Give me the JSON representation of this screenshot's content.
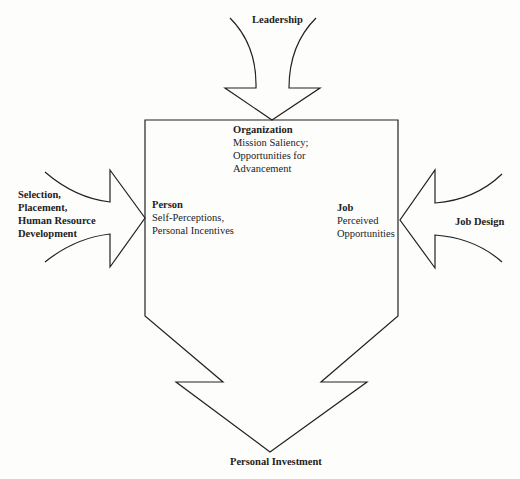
{
  "diagram": {
    "inputs": {
      "top": {
        "label": "Leadership"
      },
      "left": {
        "lines": [
          "Selection,",
          "Placement,",
          "Human Resource",
          "Development"
        ]
      },
      "right": {
        "label": "Job Design"
      }
    },
    "nodes": {
      "organization": {
        "title": "Organization",
        "lines": [
          "Mission Saliency;",
          "Opportunities for",
          "Advancement"
        ]
      },
      "person": {
        "title": "Person",
        "lines": [
          "Self-Perceptions,",
          "Personal Incentives"
        ]
      },
      "job": {
        "title": "Job",
        "lines": [
          "Perceived",
          "Opportunities"
        ]
      }
    },
    "output": {
      "label": "Personal Investment"
    },
    "colors": {
      "stroke": "#222222",
      "background": "#fdfdfc"
    }
  }
}
